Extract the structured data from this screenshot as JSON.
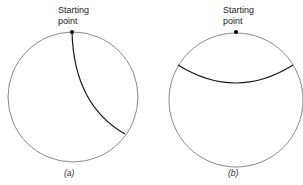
{
  "panels": [
    {
      "id": "a",
      "caption": "(a)",
      "start_label_line1": "Starting",
      "start_label_line2": "point",
      "circle": {
        "cx": 73,
        "cy": 97,
        "r": 65
      },
      "start_point": {
        "x": 72,
        "y": 32
      },
      "path_end": {
        "x": 125,
        "y": 134
      }
    },
    {
      "id": "b",
      "caption": "(b)",
      "start_label_line1": "Starting",
      "start_label_line2": "point",
      "circle": {
        "cx": 236,
        "cy": 100,
        "r": 67
      },
      "start_point": {
        "x": 236,
        "y": 32
      },
      "path_start": {
        "x": 178,
        "y": 65
      },
      "path_end": {
        "x": 293,
        "y": 65
      }
    }
  ],
  "colors": {
    "circle": "#8a8a8a",
    "path": "#1a1a1a",
    "dot": "#000000"
  }
}
